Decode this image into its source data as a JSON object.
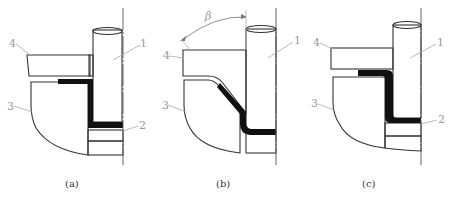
{
  "figure": {
    "panels": [
      {
        "id": "a",
        "caption": "(a)",
        "labels": {
          "punch": "1",
          "blank": "2",
          "die": "3",
          "holder": "4"
        }
      },
      {
        "id": "b",
        "caption": "(b)",
        "labels": {
          "punch": "1",
          "die": "3",
          "holder": "4"
        },
        "angle_label": "β"
      },
      {
        "id": "c",
        "caption": "(c)",
        "labels": {
          "punch": "1",
          "blank": "2",
          "die": "3",
          "holder": "4"
        }
      }
    ],
    "colors": {
      "line": "#333333",
      "hatch": "#555555",
      "material": "#111111",
      "label": "#9a9a9a"
    }
  }
}
